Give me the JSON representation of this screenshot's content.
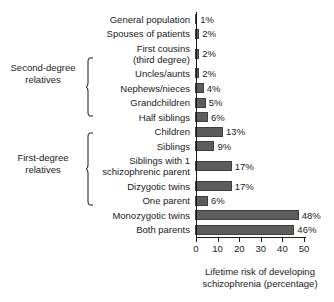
{
  "chart_data": {
    "type": "bar",
    "orientation": "horizontal",
    "title": "",
    "xlabel": "Lifetime risk of developing\nschizophrenia (percentage)",
    "ylabel": "",
    "xlim": [
      0,
      50
    ],
    "xticks": [
      0,
      10,
      20,
      30,
      40,
      50
    ],
    "xtick_labels": [
      "0",
      "10",
      "20",
      "30",
      "40",
      "50"
    ],
    "grid": false,
    "legend": null,
    "bar_color": "#5c5c5c",
    "axis_color": "#1a1a1a",
    "background_color": "#ffffff",
    "categories": [
      "General population",
      "Spouses of patients",
      "First cousins\n(third degree)",
      "Uncles/aunts",
      "Nephews/nieces",
      "Grandchildren",
      "Half siblings",
      "Children",
      "Siblings",
      "Siblings with 1\nschizophrenic parent",
      "Dizygotic twins",
      "One parent",
      "Monozygotic twins",
      "Both parents"
    ],
    "values": [
      1,
      2,
      2,
      2,
      4,
      5,
      6,
      13,
      9,
      17,
      17,
      6,
      48,
      46
    ],
    "value_labels": [
      "1%",
      "2%",
      "2%",
      "2%",
      "4%",
      "5%",
      "6%",
      "13%",
      "9%",
      "17%",
      "17%",
      "6%",
      "48%",
      "46%"
    ],
    "groups": [
      {
        "label": "Second-degree\nrelatives",
        "members": [
          "Uncles/aunts",
          "Nephews/nieces",
          "Grandchildren",
          "Half siblings"
        ]
      },
      {
        "label": "First-degree\nrelatives",
        "members": [
          "Children",
          "Siblings",
          "Siblings with 1\nschizophrenic parent",
          "Dizygotic twins",
          "One parent"
        ]
      }
    ]
  }
}
